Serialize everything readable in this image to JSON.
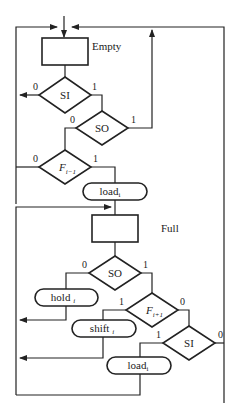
{
  "diagram": {
    "type": "flowchart",
    "states": {
      "empty": "Empty",
      "full": "Full"
    },
    "decisions": {
      "si_top": "SI",
      "so_top": "SO",
      "f_prev": "F",
      "f_prev_sub": "i−1",
      "so_bottom": "SO",
      "f_next": "F",
      "f_next_sub": "i+1",
      "si_bottom": "SI"
    },
    "actions": {
      "load_top": "load",
      "load_top_sub": "i",
      "hold": "hold",
      "hold_sub": "i",
      "shift": "shift",
      "shift_sub": "i",
      "load_bottom": "load",
      "load_bottom_sub": "i"
    },
    "branch_labels": {
      "si_top_0": "0",
      "si_top_1": "1",
      "so_top_0": "0",
      "so_top_1": "1",
      "f_prev_0": "0",
      "f_prev_1": "1",
      "so_bottom_0": "0",
      "so_bottom_1": "1",
      "f_next_1": "1",
      "f_next_0": "0",
      "si_bottom_1": "1",
      "si_bottom_0": "0"
    },
    "colors": {
      "stroke": "#222222",
      "background": "#ffffff"
    }
  }
}
